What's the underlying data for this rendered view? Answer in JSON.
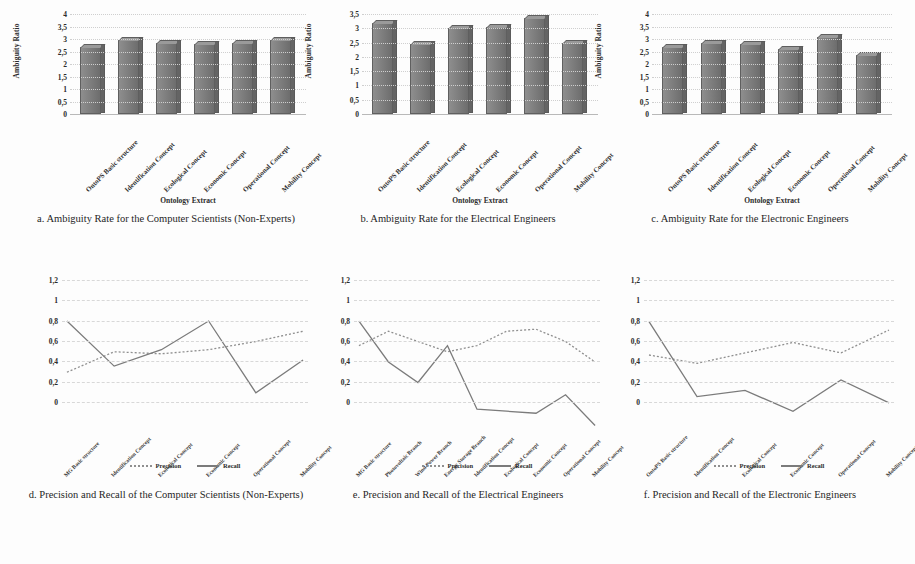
{
  "figure": {
    "background": "#fdfdfd",
    "series_colors": {
      "bar": "#7c7c7c",
      "precision": "#8f8f8f",
      "recall": "#7b7b7b"
    }
  },
  "legend": {
    "precision": "Precision",
    "recall": "Recall"
  },
  "captions": {
    "a": "a. Ambiguity Rate for the Computer Scientists (Non-Experts)",
    "b": "b. Ambiguity Rate for the Electrical Engineers",
    "c": "c. Ambiguity Rate for the Electronic Engineers",
    "d": "d. Precision and Recall of the Computer Scientists (Non-Experts)",
    "e": "e. Precision and Recall of the Electrical Engineers",
    "f": "f. Precision and Recall of the Electronic Engineers"
  },
  "axis_titles": {
    "ambiguity": "Ambiguity Ratio",
    "ontology": "Ontology Extract"
  },
  "chart_data": [
    {
      "id": "a",
      "type": "bar",
      "title": "a. Ambiguity Rate for the Computer Scientists (Non-Experts)",
      "xlabel": "Ontology Extract",
      "ylabel": "Ambiguity Ratio",
      "ylim": [
        0,
        4
      ],
      "yticks": [
        "0",
        "0,5",
        "1",
        "1,5",
        "2",
        "2,5",
        "3",
        "3,5",
        "4"
      ],
      "grid": true,
      "categories": [
        "OntoPS Basic structure",
        "Identification Concept",
        "Ecological Concept",
        "Economic Concept",
        "Operational Concept",
        "Mobility Concept"
      ],
      "values": [
        2.7,
        2.95,
        2.85,
        2.8,
        2.85,
        2.95
      ]
    },
    {
      "id": "b",
      "type": "bar",
      "title": "b. Ambiguity Rate for the Electrical Engineers",
      "xlabel": "Ontology Extract",
      "ylabel": "Ambiguity Ratio",
      "ylim": [
        0,
        3.5
      ],
      "yticks": [
        "0",
        "0,5",
        "1",
        "1,5",
        "2",
        "2,5",
        "3",
        "3,5"
      ],
      "grid": true,
      "categories": [
        "OntoPS Basic structure",
        "Identification Concept",
        "Ecological Concept",
        "Economic Concept",
        "Operational Concept",
        "Mobility Concept"
      ],
      "values": [
        3.2,
        2.45,
        3.0,
        3.05,
        3.35,
        2.5
      ]
    },
    {
      "id": "c",
      "type": "bar",
      "title": "c. Ambiguity Rate for the Electronic Engineers",
      "xlabel": "Ontology Extract",
      "ylabel": "Ambiguity Ratio",
      "ylim": [
        0,
        4
      ],
      "yticks": [
        "0",
        "0,5",
        "1",
        "1,5",
        "2",
        "2,5",
        "3",
        "3,5",
        "4"
      ],
      "grid": true,
      "categories": [
        "OntoPS Basic structure",
        "Identification Concept",
        "Ecological Concept",
        "Economic Concept",
        "Operational Concept",
        "Mobility Concept"
      ],
      "values": [
        2.7,
        2.85,
        2.8,
        2.6,
        3.1,
        2.35
      ]
    },
    {
      "id": "d",
      "type": "line",
      "title": "d. Precision and Recall of the Computer Scientists (Non-Experts)",
      "xlabel": "",
      "ylabel": "",
      "ylim": [
        0,
        1.2
      ],
      "yticks": [
        "0",
        "0,2",
        "0,4",
        "0,6",
        "0,8",
        "1",
        "1,2"
      ],
      "grid": true,
      "legend_position": "bottom",
      "categories": [
        "MG Basic structure",
        "Identification Concept",
        "Ecological Concept",
        "Economic Concept",
        "Operational Concept",
        "Mobility Concept"
      ],
      "series": [
        {
          "name": "Precision",
          "style": "dotted",
          "values": [
            0.75,
            0.85,
            0.84,
            0.86,
            0.9,
            0.95
          ]
        },
        {
          "name": "Recall",
          "style": "solid",
          "values": [
            1.0,
            0.78,
            0.86,
            1.0,
            0.65,
            0.81
          ]
        }
      ]
    },
    {
      "id": "e",
      "type": "line",
      "title": "e. Precision and Recall of the Electrical Engineers",
      "xlabel": "",
      "ylabel": "",
      "ylim": [
        0,
        1.2
      ],
      "yticks": [
        "0",
        "0,2",
        "0,4",
        "0,6",
        "0,8",
        "1",
        "1,2"
      ],
      "grid": true,
      "legend_position": "bottom",
      "categories": [
        "MG Basic structure",
        "Photovoltaic Branch",
        "Wind Power Branch",
        "Energy Storage Branch",
        "Identification Concept",
        "Ecological Concept",
        "Economic Concept",
        "Operational Concept",
        "Mobility Concept"
      ],
      "series": [
        {
          "name": "Precision",
          "style": "dotted",
          "values": [
            0.88,
            0.95,
            0.9,
            0.85,
            0.88,
            0.95,
            0.96,
            0.9,
            0.8
          ]
        },
        {
          "name": "Recall",
          "style": "solid",
          "values": [
            1.0,
            0.8,
            0.7,
            0.88,
            0.57,
            0.56,
            0.55,
            0.64,
            0.49
          ]
        }
      ]
    },
    {
      "id": "f",
      "type": "line",
      "title": "f. Precision and Recall of the Electronic Engineers",
      "xlabel": "",
      "ylabel": "",
      "ylim": [
        0,
        1.2
      ],
      "yticks": [
        "0",
        "0,2",
        "0,4",
        "0,6",
        "0,8",
        "1",
        "1,2"
      ],
      "grid": true,
      "legend_position": "bottom",
      "categories": [
        "OntoPS Basic structure",
        "Identification Concept",
        "Ecological Concept",
        "Economic Concept",
        "Operational Concept",
        "Mobility Concept"
      ],
      "series": [
        {
          "name": "Precision",
          "style": "dotted",
          "values": [
            0.84,
            0.8,
            0.85,
            0.9,
            0.85,
            0.96
          ]
        },
        {
          "name": "Recall",
          "style": "solid",
          "values": [
            1.0,
            0.64,
            0.67,
            0.57,
            0.72,
            0.61
          ]
        }
      ]
    }
  ]
}
